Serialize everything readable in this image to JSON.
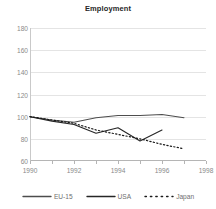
{
  "chart_data": {
    "type": "line",
    "title": "Employment",
    "xlabel": "",
    "ylabel": "",
    "xlim": [
      1990,
      1998
    ],
    "ylim": [
      60,
      180
    ],
    "ytick_labels": [
      "180",
      "160",
      "140",
      "120",
      "100",
      "80",
      "60"
    ],
    "yticks": [
      180,
      160,
      140,
      120,
      100,
      80,
      60
    ],
    "xtick_labels": [
      "1990",
      "1992",
      "1994",
      "1996",
      "1998"
    ],
    "xticks": [
      1990,
      1992,
      1994,
      1996,
      1998
    ],
    "grid": true,
    "legend_position": "bottom",
    "x": [
      1990,
      1991,
      1992,
      1993,
      1994,
      1995,
      1996,
      1997
    ],
    "series": [
      {
        "name": "EU-15",
        "style": "solid",
        "color": "#4d4d4d",
        "x": [
          1990,
          1991,
          1992,
          1993,
          1994,
          1995,
          1996,
          1997
        ],
        "values": [
          100,
          97,
          95,
          99,
          101,
          101,
          102,
          99
        ]
      },
      {
        "name": "USA",
        "style": "solid",
        "color": "#262626",
        "x": [
          1990,
          1991,
          1992,
          1993,
          1994,
          1995,
          1996
        ],
        "values": [
          100,
          96,
          93,
          85,
          90,
          78,
          88
        ]
      },
      {
        "name": "Japan",
        "style": "dotted",
        "color": "#1a1a1a",
        "x": [
          1990,
          1991,
          1992,
          1993,
          1994,
          1995,
          1996,
          1997
        ],
        "values": [
          100,
          97,
          94,
          88,
          84,
          80,
          75,
          71
        ]
      }
    ]
  },
  "legend": {
    "items": [
      {
        "label": "EU-15",
        "swatch": "line-solid-icon"
      },
      {
        "label": "USA",
        "swatch": "line-solid-icon"
      },
      {
        "label": "Japan",
        "swatch": "line-dotted-icon"
      }
    ]
  }
}
